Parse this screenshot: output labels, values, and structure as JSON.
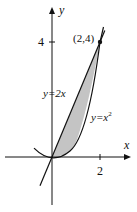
{
  "diagram": {
    "type": "region-between-curves",
    "axes": {
      "x_label": "x",
      "y_label": "y",
      "x_tick_label": "2",
      "y_tick_label": "4"
    },
    "curves": [
      {
        "name": "line",
        "equation": "y=2x",
        "label_prefix": "y=2",
        "label_var": "x"
      },
      {
        "name": "parabola",
        "equation": "y=x^2",
        "label_prefix": "y=",
        "label_var": "x",
        "label_exp": "2"
      }
    ],
    "point": {
      "label": "(2,4)",
      "x": 2,
      "y": 4
    },
    "shaded_region": {
      "from_x": 0,
      "to_x": 2,
      "color": "#c4c4c4"
    },
    "colors": {
      "ink": "#111111",
      "fill": "#c4c4c4"
    }
  }
}
